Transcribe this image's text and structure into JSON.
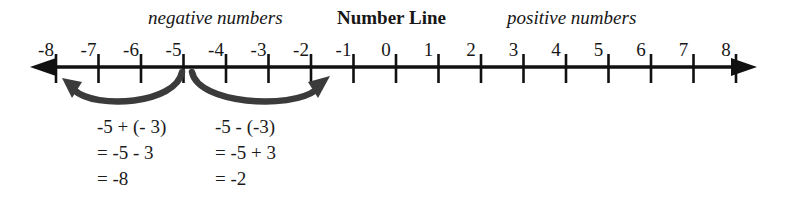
{
  "figure": {
    "title": "Number Line",
    "left_caption": "negative numbers",
    "right_caption": "positive numbers"
  },
  "number_line": {
    "tick_labels": [
      "-8",
      "-7",
      "-6",
      "-5",
      "-4",
      "-3",
      "-2",
      "-1",
      "0",
      "1",
      "2",
      "3",
      "4",
      "5",
      "6",
      "7",
      "8"
    ],
    "axis_color": "#111111",
    "left_arrow": "left-arrowhead",
    "right_arrow": "right-arrowhead"
  },
  "operations": [
    {
      "arc_name": "arc-minus-three",
      "direction": "left",
      "from_value": "-5",
      "to_value": "-8",
      "lines": [
        "-5 + (- 3)",
        "= -5 - 3",
        "= -8"
      ]
    },
    {
      "arc_name": "arc-plus-three",
      "direction": "right",
      "from_value": "-5",
      "to_value": "-2",
      "lines": [
        "-5 - (-3)",
        "= -5 + 3",
        "= -2"
      ]
    }
  ]
}
